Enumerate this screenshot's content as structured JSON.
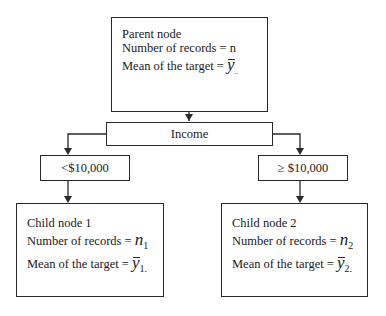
{
  "diagram": {
    "type": "decision-tree-split",
    "parent_node": {
      "title": "Parent node",
      "records_label": "Number of records = n",
      "mean_label": "Mean of the target = ",
      "mean_symbol": "y",
      "mean_subscript": ".."
    },
    "split_variable": "Income",
    "branches": [
      {
        "condition": "<$10,000",
        "child": {
          "title": "Child node 1",
          "records_label": "Number of records = ",
          "records_symbol": "n",
          "records_subscript": "1",
          "mean_label": "Mean of the target = ",
          "mean_symbol": "y",
          "mean_subscript": "1."
        }
      },
      {
        "condition": "≥ $10,000",
        "child": {
          "title": "Child node 2",
          "records_label": "Number of records = ",
          "records_symbol": "n",
          "records_subscript": "2",
          "mean_label": "Mean of the target = ",
          "mean_symbol": "y",
          "mean_subscript": "2."
        }
      }
    ],
    "colors": {
      "line": "#2a2a2a",
      "background": "#ffffff"
    }
  }
}
